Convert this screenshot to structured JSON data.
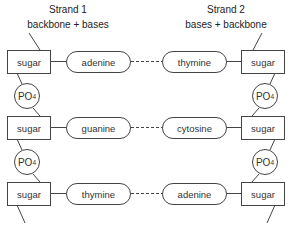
{
  "strand1": {
    "title": "Strand 1",
    "subtitle": "backbone + bases",
    "rows": [
      {
        "sugar": "sugar",
        "base": "adenine"
      },
      {
        "sugar": "sugar",
        "base": "guanine"
      },
      {
        "sugar": "sugar",
        "base": "thymine"
      }
    ],
    "phosphates": [
      {
        "label": "PO",
        "sub": "4"
      },
      {
        "label": "PO",
        "sub": "4"
      }
    ]
  },
  "strand2": {
    "title": "Strand 2",
    "subtitle": "bases + backbone",
    "rows": [
      {
        "sugar": "sugar",
        "base": "thymine"
      },
      {
        "sugar": "sugar",
        "base": "cytosine"
      },
      {
        "sugar": "sugar",
        "base": "adenine"
      }
    ],
    "phosphates": [
      {
        "label": "PO",
        "sub": "4"
      },
      {
        "label": "PO",
        "sub": "4"
      }
    ]
  },
  "colors": {
    "line": "#444444",
    "text": "#222222",
    "background": "#ffffff"
  }
}
